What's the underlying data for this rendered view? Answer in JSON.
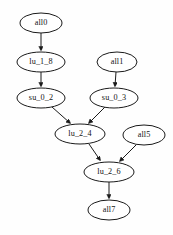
{
  "diagram": {
    "type": "directed-acyclic-graph",
    "title": "",
    "background_color": "#fefefe",
    "node_fill": "#ffffff",
    "node_stroke": "#1a1a1a",
    "edge_color": "#1a1a1a",
    "label_color": "#141414",
    "nodes": [
      {
        "id": "all0",
        "label": "all0",
        "cx": 41,
        "cy": 23,
        "rx": 21,
        "ry": 10
      },
      {
        "id": "lu_1_8",
        "label": "lu_1_8",
        "cx": 41,
        "cy": 62,
        "rx": 24,
        "ry": 10
      },
      {
        "id": "su_0_2",
        "label": "su_0_2",
        "cx": 41,
        "cy": 98,
        "rx": 24,
        "ry": 10
      },
      {
        "id": "all1",
        "label": "all1",
        "cx": 117,
        "cy": 62,
        "rx": 20,
        "ry": 10
      },
      {
        "id": "su_0_3",
        "label": "su_0_3",
        "cx": 114,
        "cy": 98,
        "rx": 24,
        "ry": 10
      },
      {
        "id": "lu_2_4",
        "label": "lu_2_4",
        "cx": 80,
        "cy": 134,
        "rx": 25,
        "ry": 10
      },
      {
        "id": "all5",
        "label": "all5",
        "cx": 144,
        "cy": 135,
        "rx": 21,
        "ry": 10
      },
      {
        "id": "lu_2_6",
        "label": "lu_2_6",
        "cx": 109,
        "cy": 172,
        "rx": 25,
        "ry": 10
      },
      {
        "id": "all7",
        "label": "all7",
        "cx": 109,
        "cy": 210,
        "rx": 21,
        "ry": 10
      }
    ],
    "edges": [
      {
        "from": "all0",
        "to": "lu_1_8",
        "x1": 41,
        "y1": 33,
        "x2": 41,
        "y2": 50
      },
      {
        "from": "lu_1_8",
        "to": "su_0_2",
        "x1": 41,
        "y1": 72,
        "x2": 41,
        "y2": 86
      },
      {
        "from": "all1",
        "to": "su_0_3",
        "x1": 116,
        "y1": 72,
        "x2": 115,
        "y2": 86
      },
      {
        "from": "su_0_2",
        "to": "lu_2_4",
        "x1": 52,
        "y1": 107,
        "x2": 70,
        "y2": 123
      },
      {
        "from": "su_0_3",
        "to": "lu_2_4",
        "x1": 105,
        "y1": 107,
        "x2": 89,
        "y2": 123
      },
      {
        "from": "lu_2_4",
        "to": "lu_2_6",
        "x1": 89,
        "y1": 144,
        "x2": 100,
        "y2": 160
      },
      {
        "from": "all5",
        "to": "lu_2_6",
        "x1": 136,
        "y1": 145,
        "x2": 120,
        "y2": 161
      },
      {
        "from": "lu_2_6",
        "to": "all7",
        "x1": 109,
        "y1": 182,
        "x2": 109,
        "y2": 198
      }
    ]
  }
}
